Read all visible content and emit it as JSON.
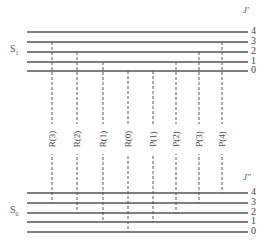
{
  "diagram": {
    "upper_state": {
      "label": "S",
      "subscript": "1",
      "j_label": "J′"
    },
    "lower_state": {
      "label": "S",
      "subscript": "0",
      "j_label": "J″"
    },
    "upper_levels": [
      {
        "j": "4",
        "y": 32
      },
      {
        "j": "3",
        "y": 42
      },
      {
        "j": "2",
        "y": 52
      },
      {
        "j": "1",
        "y": 62
      },
      {
        "j": "0",
        "y": 71
      }
    ],
    "lower_levels": [
      {
        "j": "4",
        "y": 193
      },
      {
        "j": "3",
        "y": 203
      },
      {
        "j": "2",
        "y": 213
      },
      {
        "j": "1",
        "y": 222
      },
      {
        "j": "0",
        "y": 232
      }
    ],
    "transitions": [
      {
        "label": "R(3)",
        "x": 52,
        "j_upper": 3,
        "j_lower": 3
      },
      {
        "label": "R(2)",
        "x": 77,
        "j_upper": 2,
        "j_lower": 2
      },
      {
        "label": "R(1)",
        "x": 103,
        "j_upper": 1,
        "j_lower": 1
      },
      {
        "label": "R(0)",
        "x": 128,
        "j_upper": 0,
        "j_lower": 0
      },
      {
        "label": "P(1)",
        "x": 153,
        "j_upper": 0,
        "j_lower": 1
      },
      {
        "label": "P(2)",
        "x": 176,
        "j_upper": 1,
        "j_lower": 2
      },
      {
        "label": "P(3)",
        "x": 199,
        "j_upper": 2,
        "j_lower": 3
      },
      {
        "label": "P(4)",
        "x": 222,
        "j_upper": 3,
        "j_lower": 4
      }
    ],
    "line_color": "#555555"
  }
}
